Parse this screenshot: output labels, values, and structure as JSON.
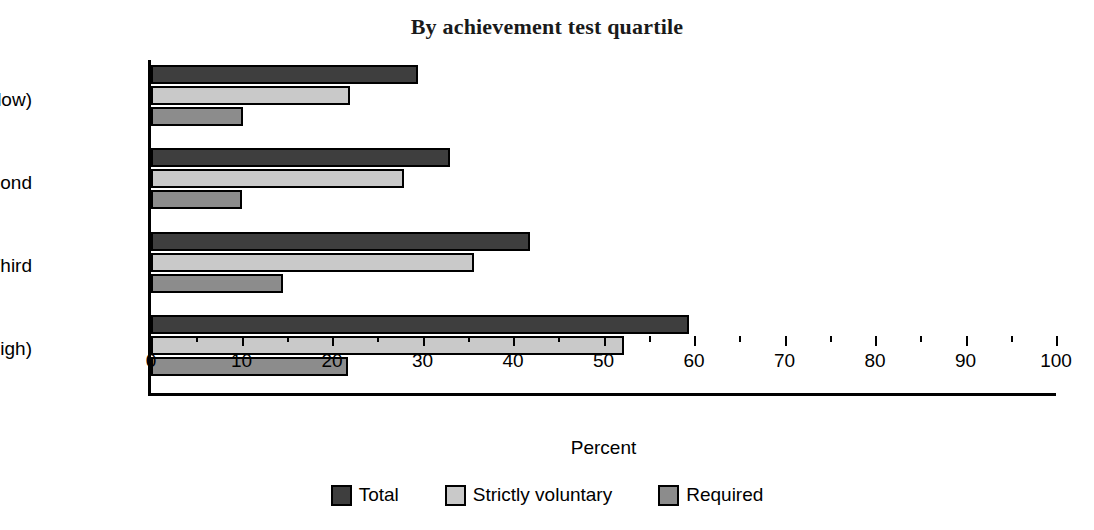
{
  "chart_data": {
    "type": "bar",
    "orientation": "horizontal",
    "title": "By achievement test quartile",
    "xlabel": "Percent",
    "ylabel": "",
    "xlim": [
      0,
      100
    ],
    "xticks": [
      0,
      10,
      20,
      30,
      40,
      50,
      60,
      70,
      80,
      90,
      100
    ],
    "xtick_labels": [
      "0",
      "10",
      "20",
      "30",
      "40",
      "50",
      "60",
      "70",
      "80",
      "90",
      "100"
    ],
    "minor_ticks": [
      5,
      15,
      25,
      35,
      45,
      55,
      65,
      75,
      85,
      95
    ],
    "grid": false,
    "legend_position": "bottom",
    "categories": [
      "First (low)",
      "Second",
      "Third",
      "Fourth (high)"
    ],
    "series": [
      {
        "name": "Total",
        "color": "#3e3e3e",
        "values": [
          29.5,
          33.0,
          41.9,
          59.4
        ]
      },
      {
        "name": "Strictly voluntary",
        "color": "#c9c9c9",
        "values": [
          22.0,
          28.0,
          35.7,
          52.3
        ]
      },
      {
        "name": "Required",
        "color": "#8c8c8c",
        "values": [
          10.2,
          10.0,
          14.6,
          21.8
        ]
      }
    ]
  },
  "legend": {
    "items": [
      {
        "label": "Total",
        "color": "#3e3e3e"
      },
      {
        "label": "Strictly voluntary",
        "color": "#c9c9c9"
      },
      {
        "label": "Required",
        "color": "#8c8c8c"
      }
    ]
  }
}
